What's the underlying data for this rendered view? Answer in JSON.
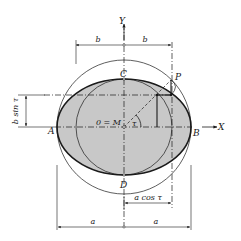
{
  "figure": {
    "labels": {
      "y_axis": "Y",
      "x_axis": "X",
      "point_a": "A",
      "point_b": "B",
      "point_c": "C",
      "point_d": "D",
      "point_p": "P",
      "origin": "0 = M",
      "angle": "τ"
    },
    "dimensions": {
      "top_left_b": "b",
      "top_right_b": "b",
      "left_bsin": "b sin τ",
      "bottom_acos": "a cos τ",
      "bottom_left_a": "a",
      "bottom_right_a": "a"
    },
    "colors": {
      "ellipse_fill": "#c8c8c8",
      "stroke": "#1a1a1a",
      "background": "#ffffff"
    },
    "geometry": {
      "center": [
        124,
        127
      ],
      "semi_major_a": 67,
      "semi_minor_b": 48,
      "point_p": [
        171,
        80
      ]
    }
  }
}
